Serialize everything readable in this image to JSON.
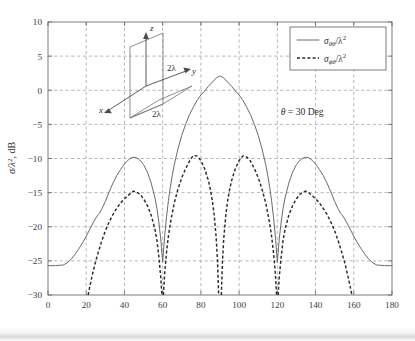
{
  "chart_data": {
    "type": "line",
    "title": "",
    "xlabel": "ϕ (Deg)",
    "ylabel": "σ/λ², dB",
    "xlim": [
      0,
      180
    ],
    "ylim": [
      -30,
      10
    ],
    "xticks": [
      0,
      20,
      40,
      60,
      80,
      100,
      120,
      140,
      160,
      180
    ],
    "yticks": [
      -30,
      -25,
      -20,
      -15,
      -10,
      -5,
      0,
      5,
      10
    ],
    "xtick_labels": [
      "0",
      "20",
      "40",
      "60",
      "80",
      "100",
      "120",
      "140",
      "160",
      "180"
    ],
    "ytick_labels": [
      "-30",
      "-25",
      "-20",
      "-15",
      "-10",
      "-5",
      "0",
      "5",
      "10"
    ],
    "grid": true,
    "grid_style": "dashed",
    "legend_position": "top-right",
    "annotations": [
      {
        "name": "theta-annotation",
        "text": "θ = 30 Deg",
        "x": 133,
        "y": -3.6
      }
    ],
    "series": [
      {
        "name": "sigma_theta_theta",
        "legend": "σθθ/λ²",
        "style": "solid",
        "color": "#6b6b6b",
        "features": {
          "main_lobe_peak_db": 2.1,
          "main_lobe_peak_deg": 90,
          "side_lobe_peak_db": -9.8,
          "side_lobe_peaks_deg": [
            44,
            136
          ],
          "nulls_deg": [
            60,
            120
          ],
          "null_depth_db": -25.2,
          "edge_level_db": -25.7
        },
        "points_deg_db": [
          [
            0,
            -25.7
          ],
          [
            4,
            -25.7
          ],
          [
            8,
            -25.6
          ],
          [
            10,
            -25.3
          ],
          [
            12,
            -24.8
          ],
          [
            14,
            -24.1
          ],
          [
            16,
            -23.3
          ],
          [
            18,
            -22.4
          ],
          [
            20,
            -21.4
          ],
          [
            22,
            -20.3
          ],
          [
            24,
            -19.2
          ],
          [
            26,
            -18.3
          ],
          [
            27,
            -18.0
          ],
          [
            28,
            -17.5
          ],
          [
            30,
            -16.3
          ],
          [
            32,
            -14.9
          ],
          [
            34,
            -13.6
          ],
          [
            36,
            -12.5
          ],
          [
            38,
            -11.6
          ],
          [
            40,
            -10.8
          ],
          [
            42,
            -10.2
          ],
          [
            44,
            -9.83
          ],
          [
            46,
            -9.85
          ],
          [
            48,
            -10.2
          ],
          [
            50,
            -10.9
          ],
          [
            52,
            -12.0
          ],
          [
            54,
            -13.6
          ],
          [
            56,
            -15.8
          ],
          [
            57,
            -17.3
          ],
          [
            58,
            -19.3
          ],
          [
            59,
            -21.8
          ],
          [
            60,
            -25.2
          ],
          [
            61,
            -21.5
          ],
          [
            62,
            -18.6
          ],
          [
            63,
            -16.2
          ],
          [
            64,
            -14.2
          ],
          [
            65,
            -12.5
          ],
          [
            66,
            -11.0
          ],
          [
            68,
            -8.6
          ],
          [
            70,
            -6.6
          ],
          [
            72,
            -5.0
          ],
          [
            74,
            -3.6
          ],
          [
            76,
            -2.5
          ],
          [
            78,
            -1.5
          ],
          [
            80,
            -0.7
          ],
          [
            82,
            -0.1
          ],
          [
            84,
            0.6
          ],
          [
            86,
            1.2
          ],
          [
            88,
            1.8
          ],
          [
            90,
            2.1
          ],
          [
            92,
            1.8
          ],
          [
            94,
            1.2
          ],
          [
            96,
            0.6
          ],
          [
            98,
            -0.1
          ],
          [
            100,
            -0.7
          ],
          [
            102,
            -1.5
          ],
          [
            104,
            -2.5
          ],
          [
            106,
            -3.6
          ],
          [
            108,
            -5.0
          ],
          [
            110,
            -6.6
          ],
          [
            112,
            -8.6
          ],
          [
            114,
            -11.0
          ],
          [
            115,
            -12.5
          ],
          [
            116,
            -14.2
          ],
          [
            117,
            -16.2
          ],
          [
            118,
            -18.6
          ],
          [
            119,
            -21.5
          ],
          [
            120,
            -25.2
          ],
          [
            121,
            -21.8
          ],
          [
            122,
            -19.3
          ],
          [
            123,
            -17.3
          ],
          [
            124,
            -15.8
          ],
          [
            126,
            -13.6
          ],
          [
            128,
            -12.0
          ],
          [
            130,
            -10.9
          ],
          [
            132,
            -10.2
          ],
          [
            134,
            -9.85
          ],
          [
            136,
            -9.83
          ],
          [
            138,
            -10.2
          ],
          [
            140,
            -10.8
          ],
          [
            142,
            -11.6
          ],
          [
            144,
            -12.5
          ],
          [
            146,
            -13.6
          ],
          [
            148,
            -14.9
          ],
          [
            150,
            -16.3
          ],
          [
            152,
            -17.5
          ],
          [
            153,
            -18.0
          ],
          [
            154,
            -18.3
          ],
          [
            156,
            -19.2
          ],
          [
            158,
            -20.3
          ],
          [
            160,
            -21.4
          ],
          [
            162,
            -22.4
          ],
          [
            164,
            -23.3
          ],
          [
            166,
            -24.1
          ],
          [
            168,
            -24.8
          ],
          [
            170,
            -25.3
          ],
          [
            172,
            -25.6
          ],
          [
            176,
            -25.7
          ],
          [
            180,
            -25.7
          ]
        ]
      },
      {
        "name": "sigma_phi_theta",
        "legend": "σϕθ/λ²",
        "style": "dashed",
        "color": "#2a2a2a",
        "features": {
          "inner_lobe_peaks_db": [
            -9.5,
            -9.8
          ],
          "inner_lobe_peaks_deg": [
            76,
            104
          ],
          "outer_lobe_peak_db": -14.8,
          "outer_lobe_peaks_deg": [
            45,
            135
          ],
          "nulls_deg": [
            60,
            90,
            120
          ],
          "clipped_below_db": -30,
          "clip_crossings_deg": [
            21,
            59,
            61.5,
            88.5,
            91.5,
            118.5,
            121,
            159
          ]
        },
        "points_deg_db": [
          [
            21,
            -30.0
          ],
          [
            22,
            -28.6
          ],
          [
            23,
            -27.3
          ],
          [
            24,
            -26.1
          ],
          [
            25,
            -25.0
          ],
          [
            26,
            -24.0
          ],
          [
            28,
            -22.2
          ],
          [
            30,
            -20.6
          ],
          [
            32,
            -19.3
          ],
          [
            34,
            -18.2
          ],
          [
            36,
            -17.3
          ],
          [
            38,
            -16.5
          ],
          [
            40,
            -15.9
          ],
          [
            42,
            -15.4
          ],
          [
            44,
            -14.9
          ],
          [
            45,
            -14.8
          ],
          [
            46,
            -14.85
          ],
          [
            48,
            -15.2
          ],
          [
            50,
            -15.9
          ],
          [
            52,
            -16.9
          ],
          [
            54,
            -18.3
          ],
          [
            56,
            -20.4
          ],
          [
            57,
            -22.0
          ],
          [
            58,
            -24.4
          ],
          [
            59,
            -27.4
          ],
          [
            59.6,
            -30.0
          ],
          [
            60.4,
            -30.0
          ],
          [
            61,
            -27.0
          ],
          [
            62,
            -23.8
          ],
          [
            63,
            -21.4
          ],
          [
            64,
            -19.5
          ],
          [
            66,
            -16.6
          ],
          [
            68,
            -14.5
          ],
          [
            70,
            -12.8
          ],
          [
            72,
            -11.5
          ],
          [
            74,
            -10.4
          ],
          [
            76,
            -9.55
          ],
          [
            78,
            -9.62
          ],
          [
            80,
            -10.3
          ],
          [
            82,
            -11.5
          ],
          [
            84,
            -13.3
          ],
          [
            85,
            -14.6
          ],
          [
            86,
            -16.2
          ],
          [
            87,
            -18.4
          ],
          [
            88,
            -21.6
          ],
          [
            88.7,
            -25.0
          ],
          [
            89.3,
            -30.0
          ],
          [
            90.7,
            -30.0
          ],
          [
            91.3,
            -25.0
          ],
          [
            92,
            -21.6
          ],
          [
            93,
            -18.4
          ],
          [
            94,
            -16.2
          ],
          [
            95,
            -14.6
          ],
          [
            96,
            -13.3
          ],
          [
            98,
            -11.5
          ],
          [
            100,
            -10.3
          ],
          [
            102,
            -9.62
          ],
          [
            104,
            -9.78
          ],
          [
            106,
            -10.4
          ],
          [
            108,
            -11.5
          ],
          [
            110,
            -12.8
          ],
          [
            112,
            -14.5
          ],
          [
            114,
            -16.6
          ],
          [
            116,
            -19.5
          ],
          [
            117,
            -21.4
          ],
          [
            118,
            -23.8
          ],
          [
            119,
            -27.0
          ],
          [
            119.6,
            -30.0
          ],
          [
            120.4,
            -30.0
          ],
          [
            121,
            -27.4
          ],
          [
            122,
            -24.4
          ],
          [
            123,
            -22.0
          ],
          [
            124,
            -20.4
          ],
          [
            126,
            -18.3
          ],
          [
            128,
            -16.9
          ],
          [
            130,
            -15.9
          ],
          [
            132,
            -15.2
          ],
          [
            134,
            -14.85
          ],
          [
            135,
            -14.8
          ],
          [
            136,
            -14.9
          ],
          [
            138,
            -15.4
          ],
          [
            140,
            -15.9
          ],
          [
            142,
            -16.5
          ],
          [
            144,
            -17.3
          ],
          [
            146,
            -18.2
          ],
          [
            148,
            -19.3
          ],
          [
            150,
            -20.6
          ],
          [
            152,
            -22.2
          ],
          [
            154,
            -24.0
          ],
          [
            155,
            -25.0
          ],
          [
            156,
            -26.1
          ],
          [
            157,
            -27.3
          ],
          [
            158,
            -28.6
          ],
          [
            159,
            -30.0
          ]
        ]
      }
    ]
  },
  "legend": {
    "entries": [
      {
        "label": "σθθ/λ²",
        "style": "solid"
      },
      {
        "label": "σϕθ/λ²",
        "style": "dashed"
      }
    ]
  },
  "inset": {
    "name": "geometry-inset",
    "axis_labels": {
      "z": "z",
      "y": "y",
      "x": "x"
    },
    "dimension_right": "2λ",
    "dimension_bottom": "2λ"
  }
}
